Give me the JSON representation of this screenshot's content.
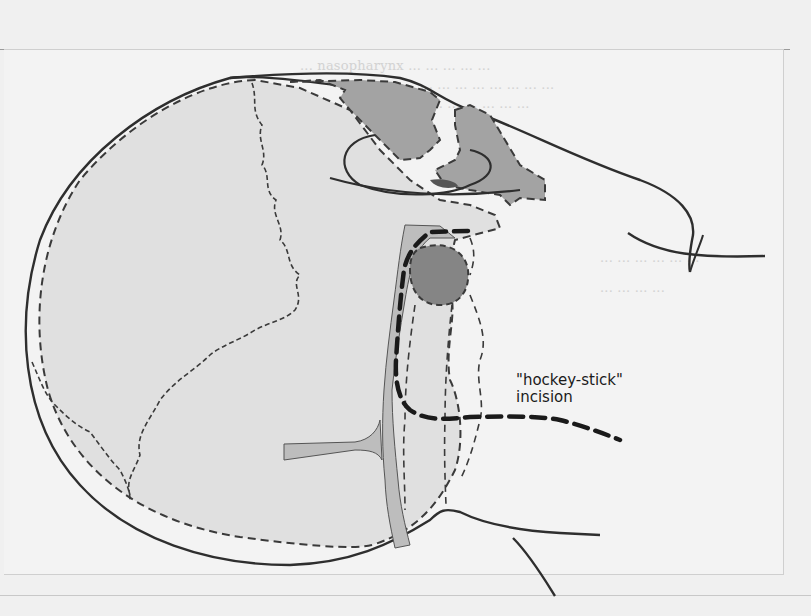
{
  "figure": {
    "label_line1": "\"hockey-stick\"",
    "label_line2": "incision"
  },
  "background_text": {
    "lines": [
      "... nasopharynx ... ... ... ... ...",
      "... ... ... ... ... ... ... ...",
      "... ... ... ... ... ...",
      "... ... ... ... ... ...",
      "... ... ... ..."
    ]
  },
  "colors": {
    "outline": "#2e2e2e",
    "dark_fill": "#8c8c8c",
    "mid_fill": "#a9a9a9",
    "light_fill": "#dcdcdc",
    "airway_fill": "#bdbdbd",
    "page": "#f1f1f1"
  }
}
